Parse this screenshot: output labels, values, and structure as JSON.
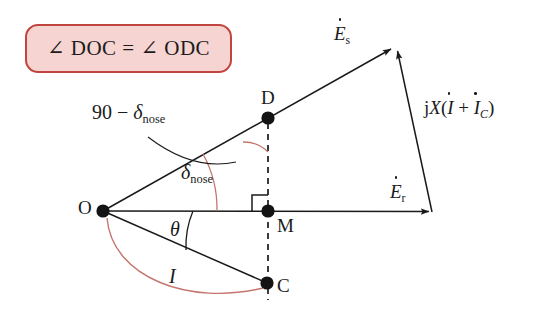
{
  "figure": {
    "type": "phasor-diagram",
    "background": "#ffffff",
    "callout": {
      "text": "∠ DOC = ∠ ODC",
      "fill": "#f6d4d1",
      "border": "#c0453e"
    },
    "colors": {
      "line": "#1a1a1a",
      "red_arc": "#c4756e",
      "dashed": "#1a1a1a",
      "text": "#1a1a1a"
    },
    "points": [
      {
        "id": "O",
        "label": "O",
        "x": 103,
        "y": 211,
        "label_x": 78,
        "label_y": 200
      },
      {
        "id": "D",
        "label": "D",
        "x": 268,
        "y": 118,
        "label_x": 261,
        "label_y": 90
      },
      {
        "id": "M",
        "label": "M",
        "x": 268,
        "y": 211,
        "label_x": 277,
        "label_y": 216
      },
      {
        "id": "C",
        "label": "C",
        "x": 267,
        "y": 283,
        "label_x": 277,
        "label_y": 278
      }
    ],
    "vectors": [
      {
        "name": "Es",
        "label": "E",
        "accent": "dot",
        "subscript": "s",
        "from": "O",
        "to_x": 394,
        "to_y": 47,
        "label_x": 335,
        "label_y": 26
      },
      {
        "name": "Er",
        "label": "E",
        "accent": "dot",
        "subscript": "r",
        "from": "O",
        "to_x": 432,
        "to_y": 212,
        "label_x": 391,
        "label_y": 184
      },
      {
        "name": "jX",
        "label": "jX(I + I_C)",
        "from_x": 432,
        "from_y": 212,
        "to_x": 398,
        "to_y": 48,
        "label_x": 428,
        "label_y": 100
      }
    ],
    "angle_labels": [
      {
        "name": "ninety-minus-delta",
        "text": "90 − δ",
        "subscript": "nose",
        "x": 92,
        "y": 104
      },
      {
        "name": "delta-nose",
        "text": "δ",
        "subscript": "nose",
        "x": 182,
        "y": 165
      },
      {
        "name": "theta",
        "text": "θ",
        "subscript": "",
        "x": 170,
        "y": 222
      },
      {
        "name": "current-I",
        "text": "I",
        "subscript": "",
        "x": 168,
        "y": 270
      }
    ],
    "markers": {
      "right_angle_at": "M",
      "right_angle_size": 16
    }
  }
}
